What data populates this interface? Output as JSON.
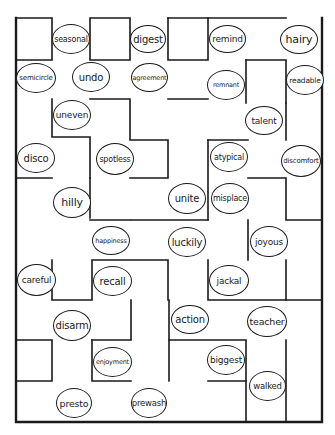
{
  "worksheet": {
    "type": "word maze",
    "ink_color": "#1a1a1a",
    "background": "#ffffff"
  },
  "words": [
    {
      "id": "seasonal",
      "label": "seasonal",
      "x": 52,
      "y": 24,
      "w": 38,
      "h": 30,
      "fs": 8
    },
    {
      "id": "digest",
      "label": "digest",
      "x": 130,
      "y": 25,
      "w": 36,
      "h": 28,
      "fs": 10
    },
    {
      "id": "remind",
      "label": "remind",
      "x": 209,
      "y": 25,
      "w": 37,
      "h": 28,
      "fs": 9
    },
    {
      "id": "hairy",
      "label": "hairy",
      "x": 280,
      "y": 25,
      "w": 38,
      "h": 29,
      "fs": 11
    },
    {
      "id": "semicircle",
      "label": "semicircle",
      "x": 16,
      "y": 63,
      "w": 40,
      "h": 30,
      "fs": 7
    },
    {
      "id": "undo",
      "label": "undo",
      "x": 72,
      "y": 62,
      "w": 38,
      "h": 30,
      "fs": 10
    },
    {
      "id": "agreement",
      "label": "agreement",
      "x": 131,
      "y": 63,
      "w": 37,
      "h": 29,
      "fs": 6.5
    },
    {
      "id": "remnant",
      "label": "remnant",
      "x": 207,
      "y": 70,
      "w": 38,
      "h": 30,
      "fs": 6.5
    },
    {
      "id": "readable",
      "label": "readable",
      "x": 286,
      "y": 65,
      "w": 38,
      "h": 30,
      "fs": 7.5
    },
    {
      "id": "uneven",
      "label": "uneven",
      "x": 53,
      "y": 100,
      "w": 38,
      "h": 30,
      "fs": 9
    },
    {
      "id": "talent",
      "label": "talent",
      "x": 245,
      "y": 106,
      "w": 38,
      "h": 29,
      "fs": 9
    },
    {
      "id": "disco",
      "label": "disco",
      "x": 17,
      "y": 143,
      "w": 38,
      "h": 30,
      "fs": 10
    },
    {
      "id": "spotless",
      "label": "spotless",
      "x": 96,
      "y": 143,
      "w": 38,
      "h": 32,
      "fs": 8
    },
    {
      "id": "atypical",
      "label": "atypical",
      "x": 210,
      "y": 142,
      "w": 38,
      "h": 30,
      "fs": 8
    },
    {
      "id": "discomfort",
      "label": "discomfort",
      "x": 281,
      "y": 145,
      "w": 40,
      "h": 32,
      "fs": 7
    },
    {
      "id": "hilly",
      "label": "hilly",
      "x": 53,
      "y": 187,
      "w": 38,
      "h": 31,
      "fs": 11
    },
    {
      "id": "unite",
      "label": "unite",
      "x": 168,
      "y": 183,
      "w": 38,
      "h": 31,
      "fs": 10
    },
    {
      "id": "misplace",
      "label": "misplace",
      "x": 211,
      "y": 183,
      "w": 38,
      "h": 31,
      "fs": 8
    },
    {
      "id": "happiness",
      "label": "happiness",
      "x": 92,
      "y": 226,
      "w": 38,
      "h": 29,
      "fs": 6.5
    },
    {
      "id": "luckily",
      "label": "luckily",
      "x": 168,
      "y": 227,
      "w": 38,
      "h": 30,
      "fs": 10
    },
    {
      "id": "joyous",
      "label": "joyous",
      "x": 250,
      "y": 226,
      "w": 38,
      "h": 31,
      "fs": 9
    },
    {
      "id": "careful",
      "label": "careful",
      "x": 17,
      "y": 264,
      "w": 39,
      "h": 32,
      "fs": 9
    },
    {
      "id": "recall",
      "label": "recall",
      "x": 93,
      "y": 266,
      "w": 39,
      "h": 30,
      "fs": 10
    },
    {
      "id": "jackal",
      "label": "jackal",
      "x": 209,
      "y": 265,
      "w": 40,
      "h": 31,
      "fs": 9
    },
    {
      "id": "disarm",
      "label": "disarm",
      "x": 53,
      "y": 310,
      "w": 38,
      "h": 31,
      "fs": 10
    },
    {
      "id": "action",
      "label": "action",
      "x": 171,
      "y": 305,
      "w": 38,
      "h": 29,
      "fs": 10
    },
    {
      "id": "teacher",
      "label": "teacher",
      "x": 247,
      "y": 306,
      "w": 40,
      "h": 31,
      "fs": 9.5
    },
    {
      "id": "enjoyment",
      "label": "enjoyment",
      "x": 93,
      "y": 347,
      "w": 39,
      "h": 30,
      "fs": 6.5
    },
    {
      "id": "biggest",
      "label": "biggest",
      "x": 207,
      "y": 345,
      "w": 38,
      "h": 30,
      "fs": 9
    },
    {
      "id": "walked",
      "label": "walked",
      "x": 249,
      "y": 371,
      "w": 37,
      "h": 30,
      "fs": 8.5
    },
    {
      "id": "presto",
      "label": "presto",
      "x": 56,
      "y": 388,
      "w": 36,
      "h": 30,
      "fs": 9.5
    },
    {
      "id": "prewash",
      "label": "prewash",
      "x": 131,
      "y": 388,
      "w": 36,
      "h": 30,
      "fs": 8.5
    }
  ]
}
